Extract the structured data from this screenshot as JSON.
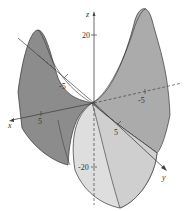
{
  "figure": {
    "type": "3d-surface-plot",
    "surface": "saddle",
    "axes": {
      "x": {
        "label": "x",
        "ticks": [
          "5"
        ]
      },
      "y": {
        "label": "y",
        "ticks": [
          "5"
        ]
      },
      "z": {
        "label": "z",
        "ticks": [
          "20",
          "-20"
        ]
      },
      "neg_x_tick": "-5",
      "neg_y_tick": "-5"
    },
    "colors": {
      "dark_face": "#8a8a8a",
      "mid_face": "#b0b0b0",
      "light_face": "#d6d6d6",
      "lightest_face": "#e8e8e8",
      "edge": "#333333",
      "axis": "#444444"
    }
  }
}
